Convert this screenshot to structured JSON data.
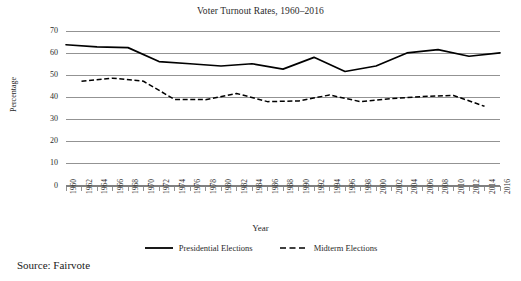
{
  "chart_data": {
    "type": "line",
    "title": "Voter Turnout Rates, 1960–2016",
    "xlabel": "Year",
    "ylabel": "Percentage",
    "ylim": [
      0,
      70
    ],
    "ytick_step": 10,
    "yticks": [
      0,
      10,
      20,
      30,
      40,
      50,
      60,
      70
    ],
    "grid": true,
    "legend_position": "bottom",
    "x": [
      1960,
      1962,
      1964,
      1966,
      1968,
      1970,
      1972,
      1974,
      1976,
      1978,
      1980,
      1982,
      1984,
      1986,
      1988,
      1990,
      1992,
      1994,
      1996,
      1998,
      2000,
      2002,
      2004,
      2006,
      2008,
      2010,
      2012,
      2014,
      2016
    ],
    "categories": [
      "1960",
      "1962",
      "1964",
      "1966",
      "1968",
      "1970",
      "1972",
      "1974",
      "1976",
      "1978",
      "1980",
      "1982",
      "1984",
      "1986",
      "1988",
      "1990",
      "1992",
      "1994",
      "1996",
      "1998",
      "2000",
      "2002",
      "2004",
      "2006",
      "2008",
      "2010",
      "2012",
      "2014",
      "2016"
    ],
    "series": [
      {
        "name": "Presidential Elections",
        "style": "solid",
        "color": "#000000",
        "values": [
          63.8,
          null,
          62.8,
          null,
          62.5,
          null,
          56.2,
          null,
          55.2,
          null,
          54.2,
          null,
          55.2,
          null,
          52.8,
          null,
          58.1,
          null,
          51.7,
          null,
          54.2,
          null,
          60.1,
          null,
          61.6,
          null,
          58.6,
          null,
          60.1
        ]
      },
      {
        "name": "Midterm Elections",
        "style": "dashed",
        "color": "#000000",
        "values": [
          null,
          47.3,
          null,
          48.7,
          null,
          47.3,
          null,
          39.1,
          null,
          39.0,
          null,
          41.8,
          null,
          38.1,
          null,
          38.4,
          null,
          41.1,
          null,
          38.1,
          null,
          39.5,
          null,
          40.4,
          null,
          40.9,
          null,
          36.0,
          null
        ]
      }
    ],
    "presidential_points": [
      {
        "year": 1960,
        "value": 63.8
      },
      {
        "year": 1964,
        "value": 62.8
      },
      {
        "year": 1968,
        "value": 62.5
      },
      {
        "year": 1972,
        "value": 56.2
      },
      {
        "year": 1976,
        "value": 55.2
      },
      {
        "year": 1980,
        "value": 54.2
      },
      {
        "year": 1984,
        "value": 55.2
      },
      {
        "year": 1988,
        "value": 52.8
      },
      {
        "year": 1992,
        "value": 58.1
      },
      {
        "year": 1996,
        "value": 51.7
      },
      {
        "year": 2000,
        "value": 54.2
      },
      {
        "year": 2004,
        "value": 60.1
      },
      {
        "year": 2008,
        "value": 61.6
      },
      {
        "year": 2012,
        "value": 58.6
      },
      {
        "year": 2016,
        "value": 60.1
      }
    ],
    "midterm_points": [
      {
        "year": 1962,
        "value": 47.3
      },
      {
        "year": 1966,
        "value": 48.7
      },
      {
        "year": 1970,
        "value": 47.3
      },
      {
        "year": 1974,
        "value": 39.1
      },
      {
        "year": 1978,
        "value": 39.0
      },
      {
        "year": 1982,
        "value": 41.8
      },
      {
        "year": 1986,
        "value": 38.1
      },
      {
        "year": 1990,
        "value": 38.4
      },
      {
        "year": 1994,
        "value": 41.1
      },
      {
        "year": 1998,
        "value": 38.1
      },
      {
        "year": 2002,
        "value": 39.5
      },
      {
        "year": 2006,
        "value": 40.4
      },
      {
        "year": 2010,
        "value": 40.9
      },
      {
        "year": 2014,
        "value": 36.0
      }
    ]
  },
  "legend": {
    "presidential_label": "Presidential Elections",
    "midterm_label": "Midterm Elections"
  },
  "source": {
    "note": "Source: Fairvote"
  },
  "colors": {
    "line": "#000000",
    "gridline": "#808080",
    "text": "#2a2a2a",
    "background": "#ffffff"
  }
}
